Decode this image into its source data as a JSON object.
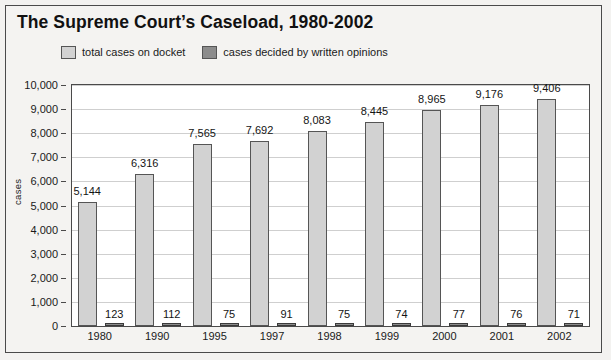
{
  "chart_data": {
    "type": "bar",
    "title": "The Supreme Court’s Caseload, 1980-2002",
    "xlabel": "",
    "ylabel": "cases",
    "ylim": [
      0,
      10000
    ],
    "ytick_labels": [
      "10,000",
      "9,000",
      "8,000",
      "7,000",
      "6,000",
      "5,000",
      "4,000",
      "3,000",
      "2,000",
      "1,000",
      "0"
    ],
    "ytick_values": [
      10000,
      9000,
      8000,
      7000,
      6000,
      5000,
      4000,
      3000,
      2000,
      1000,
      0
    ],
    "grid": true,
    "legend_position": "top",
    "categories": [
      "1980",
      "1990",
      "1995",
      "1997",
      "1998",
      "1999",
      "2000",
      "2001",
      "2002"
    ],
    "series": [
      {
        "name": "total cases on docket",
        "color": "#d2d2d2",
        "values": [
          5144,
          6316,
          7565,
          7692,
          8083,
          8445,
          8965,
          9176,
          9406
        ],
        "value_labels": [
          "5,144",
          "6,316",
          "7,565",
          "7,692",
          "8,083",
          "8,445",
          "8,965",
          "9,176",
          "9,406"
        ]
      },
      {
        "name": "cases decided by written opinions",
        "color": "#8c8c8c",
        "values": [
          123,
          112,
          75,
          91,
          75,
          74,
          77,
          76,
          71
        ],
        "value_labels": [
          "123",
          "112",
          "75",
          "91",
          "75",
          "74",
          "77",
          "76",
          "71"
        ]
      }
    ]
  },
  "legend": {
    "items": [
      {
        "label": "total cases on docket",
        "color": "#d2d2d2"
      },
      {
        "label": "cases decided by written opinions",
        "color": "#8c8c8c"
      }
    ]
  }
}
